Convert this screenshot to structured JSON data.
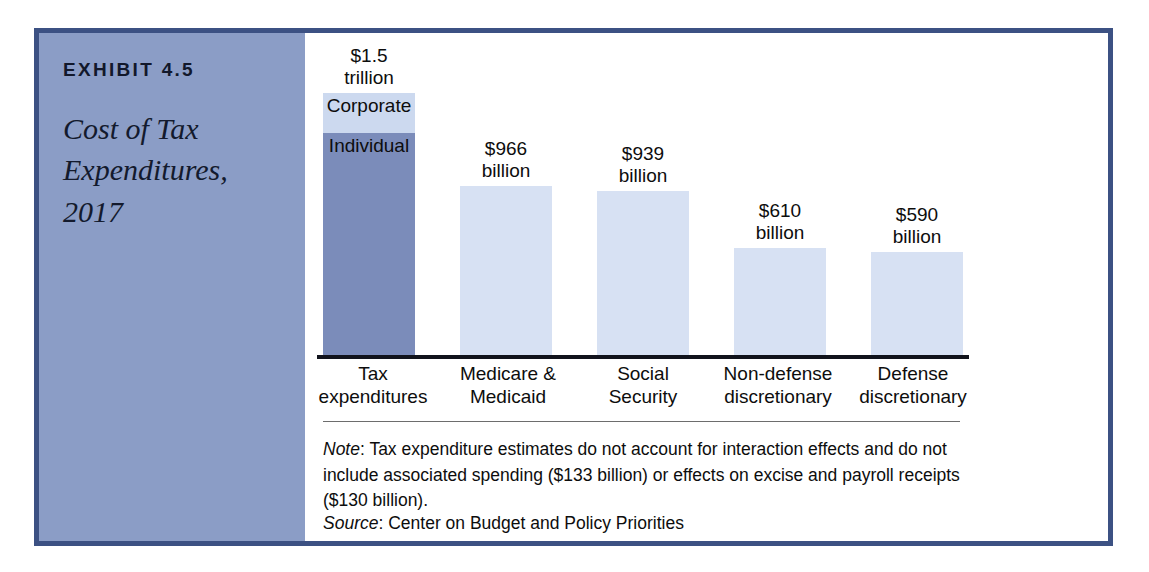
{
  "exhibit": {
    "number": "EXHIBIT 4.5",
    "title": "Cost of Tax Expenditures, 2017"
  },
  "colors": {
    "frame_border": "#3c5183",
    "caption_panel_bg": "#8b9dc6",
    "bar_light": "#d7e1f3",
    "segment_corporate": "#ccd9ef",
    "segment_individual": "#7b8cba",
    "axis_line": "#11131c",
    "divider": "#6d6d6d",
    "panel_bg": "#ffffff"
  },
  "chart_data": {
    "type": "bar",
    "title": "Cost of Tax Expenditures, 2017",
    "xlabel": "",
    "ylabel": "",
    "ylim": [
      0,
      1500
    ],
    "grid": false,
    "legend_position": "in-bar",
    "units": "billions of US dollars",
    "categories": [
      "Tax\nexpenditures",
      "Medicare &\nMedicaid",
      "Social\nSecurity",
      "Non-defense\ndiscretionary",
      "Defense\ndiscretionary"
    ],
    "values": [
      1500,
      966,
      939,
      610,
      590
    ],
    "value_labels": [
      "$1.5\ntrillion",
      "$966\nbillion",
      "$939\nbillion",
      "$610\nbillion",
      "$590\nbillion"
    ],
    "stacked_first_bar": {
      "category": "Tax expenditures",
      "segments": [
        {
          "name": "Corporate",
          "label": "Corporate",
          "value": 230
        },
        {
          "name": "Individual",
          "label": "Individual",
          "value": 1270
        }
      ]
    },
    "bars": [
      {
        "category": "Tax expenditures",
        "category_label": "Tax\nexpenditures",
        "value": 1500,
        "value_label": "$1.5\ntrillion",
        "stacked": true,
        "segments": [
          {
            "label": "Corporate",
            "value": 230,
            "color": "#ccd9ef"
          },
          {
            "label": "Individual",
            "value": 1270,
            "color": "#7b8cba"
          }
        ]
      },
      {
        "category": "Medicare & Medicaid",
        "category_label": "Medicare &\nMedicaid",
        "value": 966,
        "value_label": "$966\nbillion",
        "stacked": false,
        "color": "#d7e1f3"
      },
      {
        "category": "Social Security",
        "category_label": "Social\nSecurity",
        "value": 939,
        "value_label": "$939\nbillion",
        "stacked": false,
        "color": "#d7e1f3"
      },
      {
        "category": "Non-defense discretionary",
        "category_label": "Non-defense\ndiscretionary",
        "value": 610,
        "value_label": "$610\nbillion",
        "stacked": false,
        "color": "#d7e1f3"
      },
      {
        "category": "Defense discretionary",
        "category_label": "Defense\ndiscretionary",
        "value": 590,
        "value_label": "$590\nbillion",
        "stacked": false,
        "color": "#d7e1f3"
      }
    ]
  },
  "footnotes": {
    "note_lead": "Note",
    "note_text": ": Tax expenditure estimates do not account for interaction effects and do not include associated spending ($133 billion) or effects on excise and payroll receipts ($130 billion).",
    "source_lead": "Source",
    "source_text": ": Center on Budget and Policy Priorities"
  }
}
